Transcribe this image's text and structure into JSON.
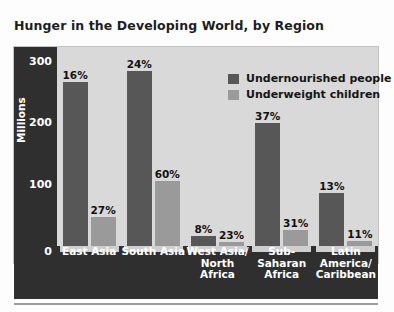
{
  "title": "Hunger in the Developing World, by Region",
  "chart_data": {
    "type": "bar",
    "title": "Hunger in the Developing World, by Region",
    "xlabel": "",
    "ylabel": "Millions",
    "ylim": [
      0,
      300
    ],
    "yticks": [
      "0",
      "100",
      "200",
      "300"
    ],
    "grid": false,
    "legend_position": "top-right",
    "categories": [
      "East Asia",
      "South Asia",
      "West Asia/ North Africa",
      "Sub- Saharan Africa",
      "Latin America/ Caribbean"
    ],
    "category_lines": [
      [
        "East Asia"
      ],
      [
        "South Asia"
      ],
      [
        "West Asia/",
        "North",
        "Africa"
      ],
      [
        "Sub-",
        "Saharan",
        "Africa"
      ],
      [
        "Latin",
        "America/",
        "Caribbean"
      ]
    ],
    "series": [
      {
        "name": "Undernourished people",
        "color": "#575757",
        "values": [
          248,
          264,
          15,
          186,
          80
        ],
        "labels": [
          "16%",
          "24%",
          "8%",
          "37%",
          "13%"
        ]
      },
      {
        "name": "Underweight children",
        "color": "#9a9a9a",
        "values": [
          44,
          98,
          6,
          24,
          8
        ],
        "labels": [
          "27%",
          "60%",
          "23%",
          "31%",
          "11%"
        ]
      }
    ]
  },
  "legend": [
    {
      "label": "Undernourished people",
      "swatch": "dark"
    },
    {
      "label": "Underweight children",
      "swatch": "light"
    }
  ],
  "axis": {
    "zero_label": "0",
    "ticks": [
      {
        "value": "300",
        "pos": 0
      },
      {
        "value": "200",
        "pos": 61
      },
      {
        "value": "100",
        "pos": 123
      }
    ]
  }
}
